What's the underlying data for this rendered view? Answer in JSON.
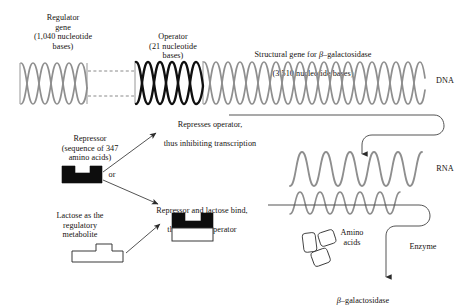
{
  "diagram": {
    "title_implicit": "Gene regulation: lac operon",
    "dna": {
      "regulator_label": "Regulator\ngene\n(1,040 nucleotide\nbases)",
      "operator_label": "Operator\n(21 nucleotide\nbases)",
      "structural_label_line1_pre": "Structural gene for ",
      "structural_label_line1_sym": "β",
      "structural_label_line1_post": "–galactosidase",
      "structural_label_line2": "(3,510 nucleotide bases)",
      "strand_label": "DNA"
    },
    "rna": {
      "strand_label": "RNA"
    },
    "repressor": {
      "label": "Repressor\n(sequence of 347\namino acids)",
      "or_label": "or"
    },
    "lactose": {
      "label": "Lactose as the\nregulatory\nmetabolite"
    },
    "pathway_repress": {
      "line1": "Represses operator,",
      "line2": "thus inhibiting  transcription"
    },
    "pathway_bind": {
      "line1": "Repressor and lactose bind,",
      "line2": "thus freeing operator"
    },
    "enzyme": {
      "amino_label": "Amino\nacids",
      "enzyme_label": "Enzyme",
      "product_sym": "β",
      "product_post": "–galactosidase"
    },
    "colors": {
      "dna_gray": "#8a8a8a",
      "dna_black": "#111111",
      "rna_gray": "#8e8e8e",
      "line_gray": "#6e6e6e",
      "text": "#16120f",
      "block_black": "#0d0d0d",
      "background": "#ffffff"
    }
  }
}
